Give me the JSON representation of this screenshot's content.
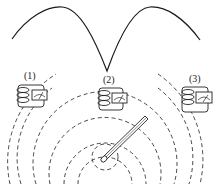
{
  "diagram": {
    "type": "physics-resonance-illustration",
    "curve": {
      "description": "resonance curve with two arches meeting at a cusp above receiver (2)",
      "color": "#1a1a1a"
    },
    "receivers": [
      {
        "label": "(1)",
        "position": "left"
      },
      {
        "label": "(2)",
        "position": "center"
      },
      {
        "label": "(3)",
        "position": "right"
      }
    ],
    "source": {
      "description": "emitting antenna rod with concentric dashed wavefronts"
    },
    "wavefront_color": "#333333"
  }
}
